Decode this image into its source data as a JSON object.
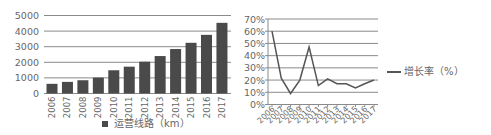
{
  "chart_data": [
    {
      "type": "bar",
      "title": "",
      "xlabel": "",
      "ylabel": "",
      "categories": [
        "2006",
        "2007",
        "2008",
        "2009",
        "2010",
        "2011",
        "2012",
        "2013",
        "2014",
        "2015",
        "2016",
        "2017"
      ],
      "series": [
        {
          "name": "运营线路（km）",
          "values": [
            620,
            745,
            850,
            1020,
            1490,
            1720,
            2040,
            2400,
            2850,
            3250,
            3760,
            4530
          ],
          "color": "#4a4a4a"
        }
      ],
      "ylim": [
        0,
        5000
      ],
      "yticks": [
        0,
        1000,
        2000,
        3000,
        4000,
        5000
      ],
      "grid": true,
      "legend_position": "bottom"
    },
    {
      "type": "line",
      "title": "",
      "xlabel": "",
      "ylabel": "",
      "categories": [
        "2006",
        "2007",
        "2008",
        "2009",
        "2010",
        "2011",
        "2012",
        "2013",
        "2014",
        "2015",
        "2016",
        "2017"
      ],
      "series": [
        {
          "name": "增长率（%）",
          "values": [
            60,
            21.5,
            9,
            20,
            47,
            15.5,
            21,
            17,
            17,
            13.5,
            17,
            20
          ],
          "color": "#555555"
        }
      ],
      "ylim": [
        0,
        70
      ],
      "yticks": [
        "0%",
        "10%",
        "20%",
        "30%",
        "40%",
        "50%",
        "60%",
        "70%"
      ],
      "grid": true,
      "legend_position": "right"
    }
  ],
  "legends": {
    "bar": "运营线路（km）",
    "line": "增长率（%）"
  }
}
